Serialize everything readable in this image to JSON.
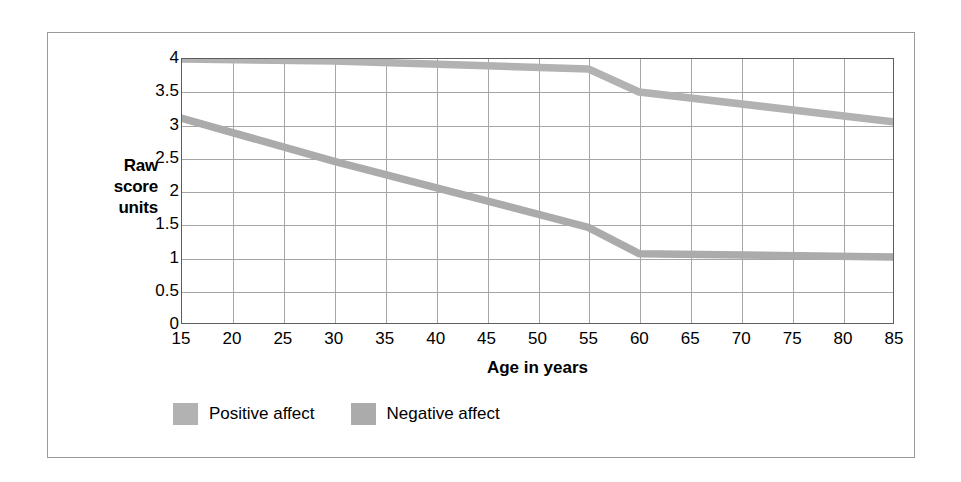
{
  "chart_data": {
    "type": "line",
    "title": "",
    "subtitle": "",
    "xlabel": "Age in years",
    "ylabel": "Raw score units",
    "ylabel_lines": [
      "Raw",
      "score",
      "units"
    ],
    "xlim": [
      15,
      85
    ],
    "ylim": [
      0,
      4
    ],
    "grid": true,
    "legend_position": "below-axis-left",
    "x_ticks": [
      15,
      20,
      25,
      30,
      35,
      40,
      45,
      50,
      55,
      60,
      65,
      70,
      75,
      80,
      85
    ],
    "x_tick_labels": [
      "15",
      "20",
      "25",
      "30",
      "35",
      "40",
      "45",
      "50",
      "55",
      "60",
      "65",
      "70",
      "75",
      "80",
      "85"
    ],
    "y_ticks": [
      0,
      0.5,
      1,
      1.5,
      2,
      2.5,
      3,
      3.5,
      4
    ],
    "y_tick_labels": [
      "0",
      "0.5",
      "1",
      "1.5",
      "2",
      "2.5",
      "3",
      "3.5",
      "4"
    ],
    "x": [
      15,
      30,
      55,
      60,
      85
    ],
    "series": [
      {
        "name": "Positive affect",
        "color": "#b2b2b2",
        "x": [
          15,
          30,
          55,
          60,
          85
        ],
        "values": [
          4.0,
          3.97,
          3.85,
          3.5,
          3.05
        ]
      },
      {
        "name": "Negative affect",
        "color": "#ababab",
        "x": [
          15,
          30,
          55,
          60,
          85
        ],
        "values": [
          3.1,
          2.45,
          1.45,
          1.05,
          1.0
        ]
      }
    ]
  },
  "axes": {
    "y_title": "Raw score units",
    "x_title": "Age in years"
  },
  "legend": {
    "items": [
      {
        "label": "Positive affect",
        "color": "#b2b2b2"
      },
      {
        "label": "Negative affect",
        "color": "#ababab"
      }
    ]
  }
}
